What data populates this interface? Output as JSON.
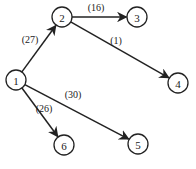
{
  "graph": {
    "directed": true,
    "nodes": [
      {
        "id": "1",
        "label": "1",
        "x": 16,
        "y": 80
      },
      {
        "id": "2",
        "label": "2",
        "x": 62,
        "y": 17
      },
      {
        "id": "3",
        "label": "3",
        "x": 137,
        "y": 17
      },
      {
        "id": "4",
        "label": "4",
        "x": 178,
        "y": 83
      },
      {
        "id": "5",
        "label": "5",
        "x": 138,
        "y": 144
      },
      {
        "id": "6",
        "label": "6",
        "x": 64,
        "y": 145
      }
    ],
    "edges": [
      {
        "from": "1",
        "to": "2",
        "label": "(27)",
        "lx": 30,
        "ly": 39
      },
      {
        "from": "2",
        "to": "3",
        "label": "(16)",
        "lx": 96,
        "ly": 7
      },
      {
        "from": "2",
        "to": "4",
        "label": "(1)",
        "lx": 116,
        "ly": 40
      },
      {
        "from": "1",
        "to": "5",
        "label": "(30)",
        "lx": 73,
        "ly": 94
      },
      {
        "from": "1",
        "to": "6",
        "label": "(26)",
        "lx": 44,
        "ly": 108
      }
    ]
  },
  "style": {
    "stroke": "#222222",
    "node_radius": 10
  }
}
